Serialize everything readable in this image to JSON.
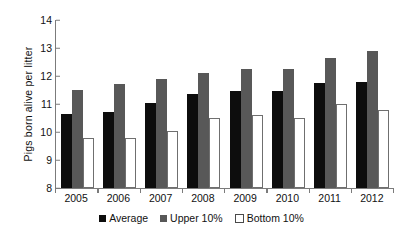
{
  "chart_data": {
    "type": "bar",
    "title": "",
    "xlabel": "",
    "ylabel": "Pigs  born  alive per litter",
    "categories": [
      "2005",
      "2006",
      "2007",
      "2008",
      "2009",
      "2010",
      "2011",
      "2012"
    ],
    "ylim": [
      8,
      14
    ],
    "yticks": [
      8,
      9,
      10,
      11,
      12,
      13,
      14
    ],
    "ytick_labels": [
      "8",
      "9",
      "10",
      "11",
      "12",
      "13",
      "14"
    ],
    "grid": false,
    "legend_position": "bottom",
    "series": [
      {
        "name": "Average",
        "color": "#0d0d0d",
        "values": [
          10.65,
          10.7,
          11.05,
          11.35,
          11.45,
          11.45,
          11.75,
          11.8
        ]
      },
      {
        "name": "Upper 10%",
        "color": "#585858",
        "values": [
          11.5,
          11.7,
          11.9,
          12.1,
          12.25,
          12.25,
          12.65,
          12.9
        ]
      },
      {
        "name": "Bottom 10%",
        "color": "#ffffff",
        "values": [
          9.8,
          9.8,
          10.05,
          10.5,
          10.6,
          10.5,
          11.0,
          10.8
        ]
      }
    ]
  },
  "legend": {
    "items": [
      {
        "label": "Average"
      },
      {
        "label": "Upper 10%"
      },
      {
        "label": "Bottom 10%"
      }
    ]
  }
}
